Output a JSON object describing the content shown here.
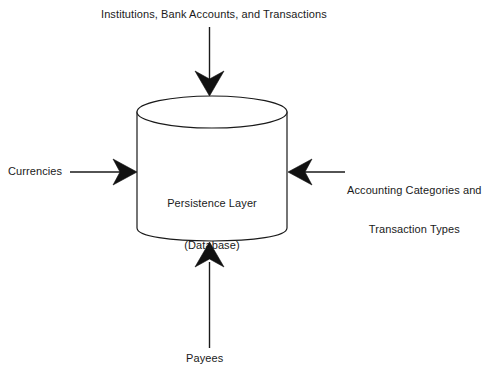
{
  "diagram": {
    "type": "flow-diagram",
    "background_color": "#ffffff",
    "stroke_color": "#1a1a1a",
    "text_color": "#1a1a1a",
    "center_node": {
      "shape": "cylinder",
      "icon_name": "database-cylinder-icon",
      "label_line1": "Persistence Layer",
      "label_line2": "(Database)"
    },
    "inputs": {
      "top": {
        "label": "Institutions, Bank Accounts, and Transactions",
        "arrow_direction": "down",
        "arrow_icon": "arrow-down-icon"
      },
      "left": {
        "label": "Currencies",
        "arrow_direction": "right",
        "arrow_icon": "arrow-right-icon"
      },
      "right": {
        "label_line1": "Accounting Categories and",
        "label_line2": "Transaction Types",
        "arrow_direction": "left",
        "arrow_icon": "arrow-left-icon"
      },
      "bottom": {
        "label": "Payees",
        "arrow_direction": "up",
        "arrow_icon": "arrow-up-icon"
      }
    }
  }
}
